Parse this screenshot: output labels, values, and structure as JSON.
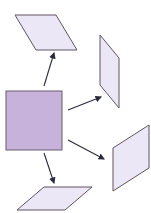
{
  "diagram": {
    "colors": {
      "square_fill": "#c7b2db",
      "square_stroke": "#6b5a6e",
      "shape_fill": "#ece7f6",
      "shape_stroke": "#5f5560",
      "arrow": "#2a2a3a"
    },
    "square": {
      "x": 6,
      "y": 91,
      "w": 56,
      "h": 59
    },
    "parallelograms": [
      {
        "id": "top",
        "points": "15,15 56,15 77,50 36,50"
      },
      {
        "id": "right-upper",
        "points": "100,35 119,58 119,108 100,85"
      },
      {
        "id": "right-lower",
        "points": "113,148 149,125 149,168 113,191"
      },
      {
        "id": "bottom",
        "points": "44,187 92,187 65,210 17,210"
      }
    ],
    "arrows": [
      {
        "id": "to-top",
        "x1": 44,
        "y1": 86,
        "x2": 54,
        "y2": 53
      },
      {
        "id": "to-right-upper",
        "x1": 68,
        "y1": 110,
        "x2": 101,
        "y2": 97
      },
      {
        "id": "to-right-lower",
        "x1": 68,
        "y1": 140,
        "x2": 104,
        "y2": 159
      },
      {
        "id": "to-bottom",
        "x1": 44,
        "y1": 153,
        "x2": 54,
        "y2": 183
      }
    ]
  }
}
